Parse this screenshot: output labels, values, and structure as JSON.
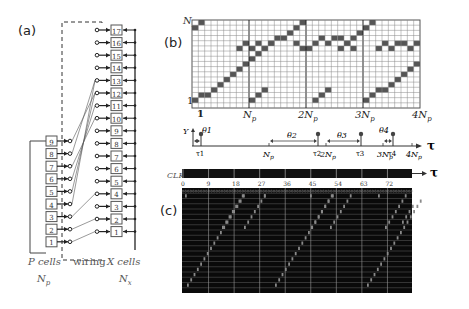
{
  "panels": {
    "a": {
      "label": "(a)",
      "p_cells": [
        "1",
        "2",
        "3",
        "4",
        "5",
        "6",
        "7",
        "8",
        "9"
      ],
      "x_cells": [
        "1",
        "2",
        "3",
        "4",
        "5",
        "6",
        "7",
        "8",
        "9",
        "10",
        "11",
        "12",
        "13",
        "14",
        "15",
        "16",
        "17"
      ],
      "wiring_map": [
        [
          1,
          1
        ],
        [
          2,
          2
        ],
        [
          3,
          4
        ],
        [
          4,
          13
        ],
        [
          5,
          12
        ],
        [
          6,
          11
        ],
        [
          7,
          10
        ],
        [
          8,
          13
        ],
        [
          9,
          12
        ]
      ],
      "p_caption": "P cells",
      "p_sub": "N",
      "p_sub_idx": "p",
      "wiring_caption": "wiring",
      "x_caption": "X cells",
      "x_sub": "N",
      "x_sub_idx": "x"
    },
    "b": {
      "label": "(b)",
      "y_top_label": "N",
      "y_top_idx": "X",
      "y_bottom_label": "1",
      "x_labels": [
        "1",
        "Np",
        "2Np",
        "3Np",
        "4Np"
      ],
      "x_label_texts": {
        "one": "1",
        "np": "N",
        "np_idx": "p",
        "two": "2N",
        "three": "3N",
        "four": "4N"
      },
      "grid_cols": 36,
      "grid_rows": 17,
      "timeline": {
        "y_label": "Y",
        "axis_label": "τ",
        "thetas": [
          "θ1",
          "θ2",
          "θ3",
          "θ4"
        ],
        "taus": [
          "τ1",
          "τ2",
          "τ3",
          "τ4"
        ],
        "ticks": [
          "Np",
          "2Np",
          "3Np",
          "4Np"
        ]
      }
    },
    "c": {
      "label": "(c)",
      "clk_label": "CLK",
      "axis_label": "τ",
      "ticks": [
        "0",
        "9",
        "18",
        "27",
        "36",
        "45",
        "54",
        "63",
        "72"
      ]
    }
  },
  "colors": {
    "cell_fill": "#555555",
    "grid_line": "#888888",
    "raster_bg": "#0a0a0a",
    "raster_line": "#9a9a9a"
  }
}
